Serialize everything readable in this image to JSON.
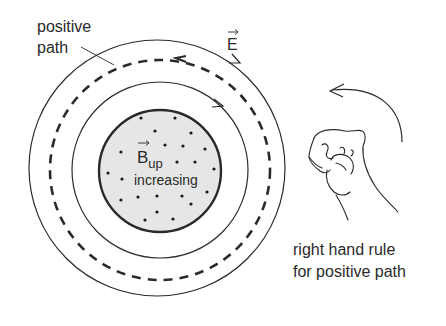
{
  "labels": {
    "positive_path_line1": "positive",
    "positive_path_line2": "path",
    "e_field": "E",
    "b_field": "B",
    "b_subscript": "up",
    "b_increasing": "increasing",
    "rule_line1": "right hand rule",
    "rule_line2": "for positive path"
  },
  "colors": {
    "stroke": "#2a2a2a",
    "disk_fill": "#e6e6e6",
    "dot": "#1a1a1a"
  },
  "dots": [
    [
      141,
      118
    ],
    [
      175,
      118
    ],
    [
      155,
      131
    ],
    [
      191,
      133
    ],
    [
      165,
      145
    ],
    [
      183,
      146
    ],
    [
      205,
      149
    ],
    [
      121,
      152
    ],
    [
      177,
      162
    ],
    [
      195,
      162
    ],
    [
      108,
      173
    ],
    [
      214,
      169
    ],
    [
      122,
      179
    ],
    [
      121,
      200
    ],
    [
      138,
      197
    ],
    [
      157,
      196
    ],
    [
      182,
      196
    ],
    [
      207,
      192
    ],
    [
      157,
      212
    ],
    [
      191,
      204
    ],
    [
      145,
      220
    ],
    [
      173,
      219
    ]
  ]
}
